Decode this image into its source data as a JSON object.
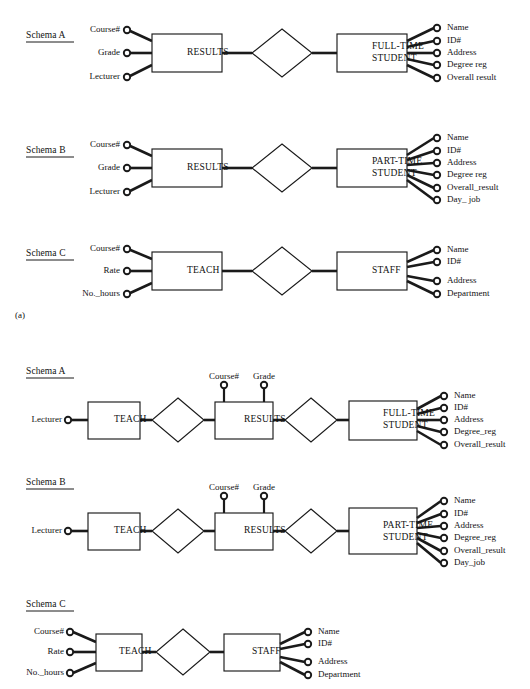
{
  "figure": {
    "part_a_label": "(a)",
    "entity_box_w": 70,
    "entity_box_h": 38
  },
  "part_a": {
    "schemas": [
      {
        "name": "Schema A",
        "left_entity": "RESULTS",
        "right_entity_line1": "FULL-TIME",
        "right_entity_line2": "STUDENT",
        "left_attributes": [
          "Course#",
          "Grade",
          "Lecturer"
        ],
        "right_attributes": [
          "Name",
          "ID#",
          "Address",
          "Degree reg",
          "Overall result"
        ]
      },
      {
        "name": "Schema B",
        "left_entity": "RESULTS",
        "right_entity_line1": "PART-TIME",
        "right_entity_line2": "STUDENT",
        "left_attributes": [
          "Course#",
          "Grade",
          "Lecturer"
        ],
        "right_attributes": [
          "Name",
          "ID#",
          "Address",
          "Degree reg",
          "Overall_result",
          "Day_ job"
        ]
      },
      {
        "name": "Schema C",
        "left_entity": "TEACH",
        "right_entity_line1": "STAFF",
        "right_entity_line2": "",
        "left_attributes": [
          "Course#",
          "Rate",
          "No._hours"
        ],
        "right_attributes": [
          "Name",
          "ID#",
          "Address",
          "Department"
        ]
      }
    ]
  },
  "part_b": {
    "schemas": [
      {
        "name": "Schema A",
        "entity1": "TEACH",
        "entity2": "RESULTS",
        "entity3_line1": "FULL-TIME",
        "entity3_line2": "STUDENT",
        "left_attribute": "Lecturer",
        "top_attributes": [
          "Course#",
          "Grade"
        ],
        "right_attributes": [
          "Name",
          "ID#",
          "Address",
          "Degree_reg",
          "Overall_result"
        ]
      },
      {
        "name": "Schema B",
        "entity1": "TEACH",
        "entity2": "RESULTS",
        "entity3_line1": "PART-TIME",
        "entity3_line2": "STUDENT",
        "left_attribute": "Lecturer",
        "top_attributes": [
          "Course#",
          "Grade"
        ],
        "right_attributes": [
          "Name",
          "ID#",
          "Address",
          "Degree_reg",
          "Overall_result",
          "Day_job"
        ]
      },
      {
        "name": "Schema C",
        "entity1": "TEACH",
        "entity2": "",
        "entity3_line1": "STAFF",
        "entity3_line2": "",
        "left_attributes": [
          "Course#",
          "Rate",
          "No._hours"
        ],
        "right_attributes": [
          "Name",
          "ID#",
          "Address",
          "Department"
        ]
      }
    ]
  },
  "colors": {
    "ink": "#1a1a1a",
    "paper": "#ffffff"
  }
}
